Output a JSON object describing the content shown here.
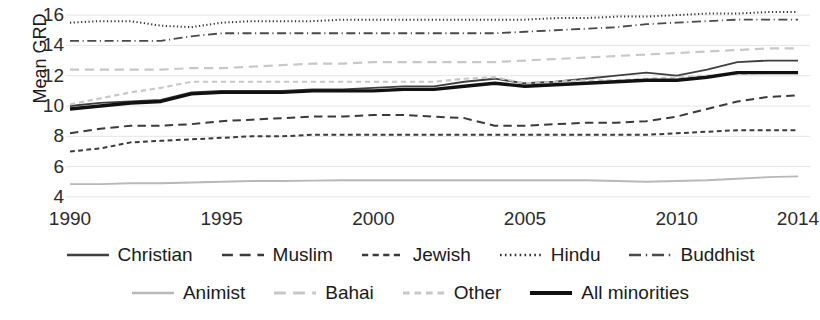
{
  "chart_data": {
    "type": "line",
    "title": "",
    "xlabel": "",
    "ylabel": "Mean GRD",
    "xlim": [
      1990,
      2014
    ],
    "ylim": [
      3.4,
      16.6
    ],
    "yticks": [
      4,
      6,
      8,
      10,
      12,
      14,
      16
    ],
    "xticks": [
      1990,
      1995,
      2000,
      2005,
      2010,
      2014
    ],
    "grid": "horizontal",
    "legend_position": "bottom",
    "x": [
      1990,
      1991,
      1992,
      1993,
      1994,
      1995,
      1996,
      1997,
      1998,
      1999,
      2000,
      2001,
      2002,
      2003,
      2004,
      2005,
      2006,
      2007,
      2008,
      2009,
      2010,
      2011,
      2012,
      2013,
      2014
    ],
    "series": [
      {
        "name": "Christian",
        "style": "solid",
        "color": "#3f3f3f",
        "width": 1.8,
        "values": [
          10.0,
          10.2,
          10.3,
          10.4,
          10.9,
          11.0,
          11.0,
          11.0,
          11.1,
          11.1,
          11.2,
          11.3,
          11.3,
          11.6,
          11.8,
          11.5,
          11.6,
          11.8,
          12.0,
          12.2,
          12.0,
          12.4,
          12.9,
          13.0,
          13.0
        ]
      },
      {
        "name": "Muslim",
        "style": "longdash",
        "color": "#3a3a3a",
        "width": 2.0,
        "values": [
          8.2,
          8.5,
          8.7,
          8.7,
          8.8,
          9.0,
          9.1,
          9.2,
          9.3,
          9.3,
          9.4,
          9.4,
          9.3,
          9.2,
          8.7,
          8.7,
          8.8,
          8.9,
          8.9,
          9.0,
          9.3,
          9.8,
          10.3,
          10.6,
          10.7
        ]
      },
      {
        "name": "Jewish",
        "style": "shortdash",
        "color": "#3a3a3a",
        "width": 2.0,
        "values": [
          7.0,
          7.2,
          7.6,
          7.7,
          7.8,
          7.9,
          8.0,
          8.0,
          8.1,
          8.1,
          8.1,
          8.1,
          8.1,
          8.1,
          8.1,
          8.1,
          8.1,
          8.1,
          8.1,
          8.1,
          8.2,
          8.3,
          8.4,
          8.4,
          8.4
        ]
      },
      {
        "name": "Hindu",
        "style": "dotted",
        "color": "#2e2e2e",
        "width": 2.0,
        "values": [
          15.5,
          15.6,
          15.6,
          15.3,
          15.2,
          15.5,
          15.6,
          15.6,
          15.6,
          15.7,
          15.7,
          15.7,
          15.7,
          15.7,
          15.7,
          15.7,
          15.8,
          15.8,
          15.9,
          15.9,
          16.0,
          16.1,
          16.1,
          16.2,
          16.2
        ]
      },
      {
        "name": "Buddhist",
        "style": "dashdot",
        "color": "#4a4a4a",
        "width": 1.8,
        "values": [
          14.3,
          14.3,
          14.3,
          14.3,
          14.6,
          14.8,
          14.8,
          14.8,
          14.8,
          14.8,
          14.8,
          14.8,
          14.8,
          14.8,
          14.8,
          14.9,
          15.0,
          15.1,
          15.2,
          15.4,
          15.5,
          15.6,
          15.7,
          15.7,
          15.7
        ]
      },
      {
        "name": "Animist",
        "style": "solid",
        "color": "#b8b8b8",
        "width": 1.8,
        "values": [
          4.85,
          4.85,
          4.9,
          4.9,
          4.95,
          5.0,
          5.05,
          5.05,
          5.08,
          5.1,
          5.1,
          5.1,
          5.1,
          5.1,
          5.1,
          5.1,
          5.1,
          5.1,
          5.05,
          5.0,
          5.05,
          5.1,
          5.2,
          5.3,
          5.35
        ]
      },
      {
        "name": "Bahai",
        "style": "longdash",
        "color": "#c8c8c8",
        "width": 2.2,
        "values": [
          12.4,
          12.4,
          12.4,
          12.4,
          12.5,
          12.5,
          12.6,
          12.7,
          12.8,
          12.8,
          12.9,
          12.9,
          12.9,
          12.9,
          12.9,
          13.0,
          13.1,
          13.2,
          13.3,
          13.4,
          13.5,
          13.6,
          13.7,
          13.8,
          13.8
        ]
      },
      {
        "name": "Other",
        "style": "shortdash",
        "color": "#c8c8c8",
        "width": 2.2,
        "values": [
          10.1,
          10.5,
          10.9,
          11.2,
          11.6,
          11.6,
          11.6,
          11.6,
          11.6,
          11.6,
          11.6,
          11.6,
          11.6,
          11.8,
          11.9,
          11.5,
          11.6,
          11.7,
          11.7,
          11.8,
          11.9,
          12.0,
          12.1,
          12.2,
          12.2
        ]
      },
      {
        "name": "All minorities",
        "style": "solid",
        "color": "#111111",
        "width": 3.4,
        "values": [
          9.8,
          10.0,
          10.2,
          10.3,
          10.8,
          10.9,
          10.9,
          10.9,
          11.0,
          11.0,
          11.0,
          11.1,
          11.1,
          11.3,
          11.5,
          11.3,
          11.4,
          11.5,
          11.6,
          11.7,
          11.7,
          11.9,
          12.2,
          12.2,
          12.2
        ]
      }
    ]
  },
  "axes": {
    "ylabel": "Mean GRD",
    "ytick_labels": [
      "16",
      "14",
      "12",
      "10",
      "8",
      "6",
      "4"
    ],
    "xtick_labels": [
      "1990",
      "1995",
      "2000",
      "2005",
      "2010",
      "2014"
    ]
  },
  "legend": {
    "row1": [
      {
        "label": "Christian",
        "style": "solid",
        "color": "#3f3f3f",
        "width": 2.4
      },
      {
        "label": "Muslim",
        "style": "longdash",
        "color": "#3a3a3a",
        "width": 2.6
      },
      {
        "label": "Jewish",
        "style": "shortdash",
        "color": "#3a3a3a",
        "width": 2.6
      },
      {
        "label": "Hindu",
        "style": "dotted",
        "color": "#2e2e2e",
        "width": 2.6
      },
      {
        "label": "Buddhist",
        "style": "dashdot",
        "color": "#4a4a4a",
        "width": 2.4
      }
    ],
    "row2": [
      {
        "label": "Animist",
        "style": "solid",
        "color": "#b8b8b8",
        "width": 2.4
      },
      {
        "label": "Bahai",
        "style": "longdash",
        "color": "#c8c8c8",
        "width": 2.8
      },
      {
        "label": "Other",
        "style": "shortdash",
        "color": "#c8c8c8",
        "width": 2.8
      },
      {
        "label": "All minorities",
        "style": "solid",
        "color": "#111111",
        "width": 4.2
      }
    ]
  },
  "colors": {
    "grid": "#e4e4e4",
    "text": "#1a1a1a",
    "background": "#ffffff"
  }
}
